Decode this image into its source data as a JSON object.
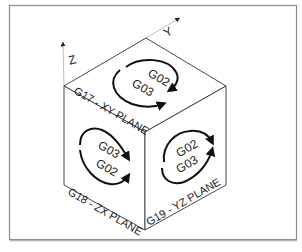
{
  "diagram": {
    "axes": {
      "x": "X",
      "y": "Y",
      "z": "Z"
    },
    "faces": {
      "top": {
        "plane_label": "G17 - XY PLANE",
        "cw_code": "G02",
        "ccw_code": "G03"
      },
      "left": {
        "plane_label": "G18 - ZX PLANE",
        "code_upper": "G03",
        "code_lower": "G02"
      },
      "right": {
        "plane_label": "G19 - YZ PLANE",
        "code_upper": "G02",
        "code_lower": "G03"
      }
    },
    "colors": {
      "frame": "#8a8a8a",
      "cube_edge": "#333333",
      "axis": "#bdbdbd",
      "arrow": "#111111",
      "text": "#1a1a1a"
    }
  }
}
